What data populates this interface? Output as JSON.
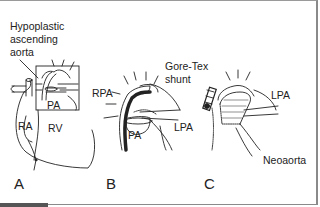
{
  "figure": {
    "panels": [
      {
        "id": "A",
        "label": "A",
        "labels": [
          "Hypoplastic",
          "ascending",
          "aorta",
          "PA",
          "RA",
          "RV"
        ]
      },
      {
        "id": "B",
        "label": "B",
        "labels": [
          "RPA",
          "PA",
          "LPA"
        ]
      },
      {
        "id": "C",
        "label": "C",
        "labels": [
          "Gore-Tex",
          "shunt",
          "LPA",
          "Neoaorta"
        ]
      }
    ],
    "annotations": {
      "hypoplastic_line1": "Hypoplastic",
      "hypoplastic_line2": "ascending",
      "hypoplastic_line3": "aorta",
      "a_pa": "PA",
      "a_ra": "RA",
      "a_rv": "RV",
      "b_rpa": "RPA",
      "b_pa": "PA",
      "b_lpa": "LPA",
      "goretex_line1": "Gore-Tex",
      "goretex_line2": "shunt",
      "c_lpa": "LPA",
      "c_neoaorta": "Neoaorta"
    },
    "colors": {
      "line": "#222222",
      "border": "#8a8a8a",
      "background": "#ffffff"
    }
  }
}
